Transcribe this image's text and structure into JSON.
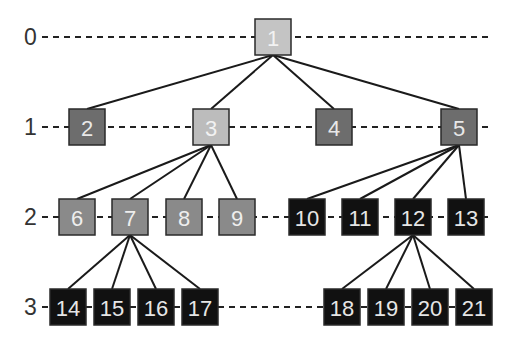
{
  "diagram": {
    "type": "tree",
    "levels": [
      {
        "label": "0",
        "level": 0
      },
      {
        "label": "1",
        "level": 1
      },
      {
        "label": "2",
        "level": 2
      },
      {
        "label": "3",
        "level": 3
      }
    ],
    "palette": {
      "root": "#c4c4c4",
      "selected": "#bcbcbc",
      "dark_gray": "#6d6d6d",
      "mid_gray": "#8a8a8a",
      "black": "#111111",
      "edge": "#1a1a1a",
      "dashed_line": "#222222"
    },
    "nodes": [
      {
        "id": "1",
        "label": "1",
        "level": 0,
        "style": "root",
        "text_color": "#f2f2f2"
      },
      {
        "id": "2",
        "label": "2",
        "level": 1,
        "style": "dark_gray",
        "text_color": "#e8e8e8"
      },
      {
        "id": "3",
        "label": "3",
        "level": 1,
        "style": "selected",
        "text_color": "#f2f2f2"
      },
      {
        "id": "4",
        "label": "4",
        "level": 1,
        "style": "dark_gray",
        "text_color": "#e8e8e8"
      },
      {
        "id": "5",
        "label": "5",
        "level": 1,
        "style": "dark_gray",
        "text_color": "#e8e8e8"
      },
      {
        "id": "6",
        "label": "6",
        "level": 2,
        "style": "mid_gray",
        "text_color": "#eeeeee"
      },
      {
        "id": "7",
        "label": "7",
        "level": 2,
        "style": "mid_gray",
        "text_color": "#eeeeee"
      },
      {
        "id": "8",
        "label": "8",
        "level": 2,
        "style": "mid_gray",
        "text_color": "#eeeeee"
      },
      {
        "id": "9",
        "label": "9",
        "level": 2,
        "style": "mid_gray",
        "text_color": "#eeeeee"
      },
      {
        "id": "10",
        "label": "10",
        "level": 2,
        "style": "black",
        "text_color": "#e6e6e6"
      },
      {
        "id": "11",
        "label": "11",
        "level": 2,
        "style": "black",
        "text_color": "#e6e6e6"
      },
      {
        "id": "12",
        "label": "12",
        "level": 2,
        "style": "black",
        "text_color": "#e6e6e6"
      },
      {
        "id": "13",
        "label": "13",
        "level": 2,
        "style": "black",
        "text_color": "#e6e6e6"
      },
      {
        "id": "14",
        "label": "14",
        "level": 3,
        "style": "black",
        "text_color": "#e6e6e6"
      },
      {
        "id": "15",
        "label": "15",
        "level": 3,
        "style": "black",
        "text_color": "#e6e6e6"
      },
      {
        "id": "16",
        "label": "16",
        "level": 3,
        "style": "black",
        "text_color": "#e6e6e6"
      },
      {
        "id": "17",
        "label": "17",
        "level": 3,
        "style": "black",
        "text_color": "#e6e6e6"
      },
      {
        "id": "18",
        "label": "18",
        "level": 3,
        "style": "black",
        "text_color": "#e6e6e6"
      },
      {
        "id": "19",
        "label": "19",
        "level": 3,
        "style": "black",
        "text_color": "#e6e6e6"
      },
      {
        "id": "20",
        "label": "20",
        "level": 3,
        "style": "black",
        "text_color": "#e6e6e6"
      },
      {
        "id": "21",
        "label": "21",
        "level": 3,
        "style": "black",
        "text_color": "#e6e6e6"
      }
    ],
    "edges": [
      [
        "1",
        "2"
      ],
      [
        "1",
        "3"
      ],
      [
        "1",
        "4"
      ],
      [
        "1",
        "5"
      ],
      [
        "3",
        "6"
      ],
      [
        "3",
        "7"
      ],
      [
        "3",
        "8"
      ],
      [
        "3",
        "9"
      ],
      [
        "5",
        "10"
      ],
      [
        "5",
        "11"
      ],
      [
        "5",
        "12"
      ],
      [
        "5",
        "13"
      ],
      [
        "7",
        "14"
      ],
      [
        "7",
        "15"
      ],
      [
        "7",
        "16"
      ],
      [
        "7",
        "17"
      ],
      [
        "12",
        "18"
      ],
      [
        "12",
        "19"
      ],
      [
        "12",
        "20"
      ],
      [
        "12",
        "21"
      ]
    ]
  }
}
